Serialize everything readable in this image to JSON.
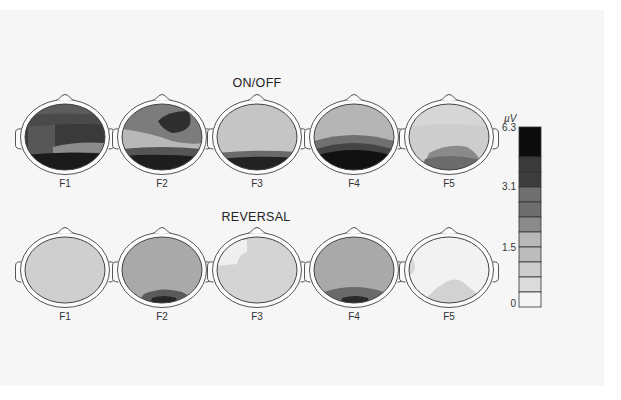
{
  "figure": {
    "rows": [
      {
        "title": "ON/OFF",
        "title_pos": [
          257,
          76
        ],
        "center_y": 137,
        "label_y": 178,
        "heads": [
          {
            "label": "F1",
            "cx": 65,
            "base": "#3a3a3a",
            "layers": [
              {
                "d": "M-37,-25 L-37,25 L-10,25 L-10,-25 Z",
                "fill": "#575757"
              },
              {
                "d": "M-40,-30 Q0,-34 40,-30 L40,-12 Q10,-15 -40,-10 Z",
                "fill": "#4a4a4a"
              },
              {
                "d": "M-40,-30 Q0,-36 40,-32 L40,-22 Q0,-25 -40,-22 Z",
                "fill": "#5c5c5c"
              },
              {
                "d": "M-12,10 Q10,4 40,6 L40,16 Q10,15 -12,16 Z",
                "fill": "#8c8c8c"
              },
              {
                "d": "M-40,18 Q0,14 40,17 L40,40 L-40,40 Z",
                "fill": "#1a1a1a"
              }
            ]
          },
          {
            "label": "F2",
            "cx": 162,
            "base": "#7c7c7c",
            "layers": [
              {
                "d": "M-40,-8 Q-10,-4 10,4 Q30,8 40,6 L40,20 Q0,18 -40,16 Z",
                "fill": "#b8b8b8"
              },
              {
                "d": "M-4,-16 Q6,-26 24,-26 Q30,-24 28,-12 Q22,-4 10,-4 Q0,-8 -4,-16 Z",
                "fill": "#2e2e2e"
              },
              {
                "d": "M-40,12 Q0,8 40,12 L40,20 Q0,17 -40,20 Z",
                "fill": "#555555"
              },
              {
                "d": "M-40,19 Q0,16 40,20 L40,40 L-40,40 Z",
                "fill": "#1d1d1d"
              }
            ]
          },
          {
            "label": "F3",
            "cx": 257,
            "base": "#c5c5c5",
            "layers": [
              {
                "d": "M-40,16 Q0,12 40,15 L40,40 L-40,40 Z",
                "fill": "#6a6a6a"
              },
              {
                "d": "M-40,22 Q0,18 40,21 L40,40 L-40,40 Z",
                "fill": "#222222"
              }
            ]
          },
          {
            "label": "F4",
            "cx": 354,
            "base": "#b5b5b5",
            "layers": [
              {
                "d": "M-40,4 Q0,-8 40,4 L40,40 L-40,40 Z",
                "fill": "#707070"
              },
              {
                "d": "M-38,12 Q0,0 38,12 L40,40 L-40,40 Z",
                "fill": "#444444"
              },
              {
                "d": "M-36,18 Q0,8 36,18 L40,40 L-40,40 Z",
                "fill": "#111111"
              }
            ]
          },
          {
            "label": "F5",
            "cx": 449,
            "base": "#d6d6d6",
            "layers": [
              {
                "d": "M-40,-10 Q0,-16 40,-10 L40,40 L-40,40 Z",
                "fill": "#cdcdcd"
              },
              {
                "d": "M-20,16 Q0,6 18,10 Q28,16 30,22 L30,40 L-30,40 Z",
                "fill": "#8a8a8a"
              },
              {
                "d": "M-24,22 Q0,16 28,22 L30,40 L-30,40 Z",
                "fill": "#6c6c6c"
              }
            ]
          }
        ]
      },
      {
        "title": "REVERSAL",
        "title_pos": [
          256,
          210
        ],
        "center_y": 270,
        "label_y": 311,
        "heads": [
          {
            "label": "F1",
            "cx": 65,
            "base": "#cfcfcf",
            "layers": []
          },
          {
            "label": "F2",
            "cx": 162,
            "base": "#a9a9a9",
            "layers": [
              {
                "d": "M-18,24 Q0,16 20,22 Q28,26 30,30 L30,40 L-30,40 Z",
                "fill": "#5a5a5a"
              },
              {
                "d": "M-10,28 Q2,24 14,28 L16,40 L-14,40 Z",
                "fill": "#262626"
              }
            ]
          },
          {
            "label": "F3",
            "cx": 257,
            "base": "#d4d4d4",
            "layers": [
              {
                "d": "M-40,-30 L-10,-30 L-10,-18 Q-18,-16 -20,-6 L-40,-4 Z",
                "fill": "#efefef"
              }
            ]
          },
          {
            "label": "F4",
            "cx": 354,
            "base": "#a9a9a9",
            "layers": [
              {
                "d": "M-30,22 Q0,12 30,22 L32,40 L-32,40 Z",
                "fill": "#6a6a6a"
              },
              {
                "d": "M-12,28 Q2,24 14,28 L16,40 L-14,40 Z",
                "fill": "#2a2a2a"
              }
            ]
          },
          {
            "label": "F5",
            "cx": 449,
            "base": "#f2f2f2",
            "layers": [
              {
                "d": "M-26,32 Q-14,18 -6,14 Q4,6 14,12 Q24,20 34,30 L34,40 L-34,40 Z",
                "fill": "#d2d2d2"
              },
              {
                "d": "M-40,-12 Q-34,-14 -34,-2 Q-36,6 -40,4 Z",
                "fill": "#d8d8d8"
              }
            ]
          }
        ]
      }
    ]
  },
  "colorbar": {
    "unit": "µV",
    "unit_pos": [
      512,
      113
    ],
    "x": 519,
    "y": 127,
    "width": 22,
    "segments": [
      {
        "h": 30,
        "fill": "#0c0c0c"
      },
      {
        "h": 15,
        "fill": "#3a3a3a"
      },
      {
        "h": 15,
        "fill": "#3c3c3c"
      },
      {
        "h": 15,
        "fill": "#6f6f6f"
      },
      {
        "h": 15,
        "fill": "#6e6e6e"
      },
      {
        "h": 15,
        "fill": "#8a8a8a"
      },
      {
        "h": 15,
        "fill": "#b8b8b8"
      },
      {
        "h": 15,
        "fill": "#bcbcbc"
      },
      {
        "h": 15,
        "fill": "#cdcdcd"
      },
      {
        "h": 15,
        "fill": "#dcdcdc"
      },
      {
        "h": 15,
        "fill": "#f4f4f4"
      }
    ],
    "ticks": [
      {
        "label": "6.3",
        "y": 122
      },
      {
        "label": "3.1",
        "y": 181
      },
      {
        "label": "1.5",
        "y": 242
      },
      {
        "label": "0",
        "y": 298
      }
    ]
  }
}
